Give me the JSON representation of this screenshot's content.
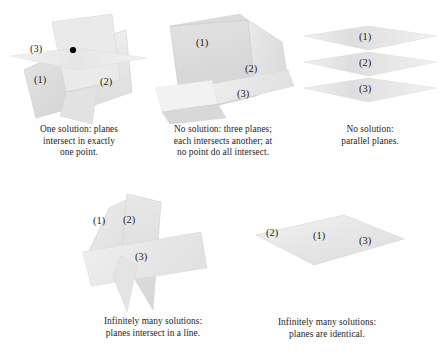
{
  "figure": {
    "background_color": "#ffffff",
    "plane_fill_light": "#e9e9e9",
    "plane_fill_mid": "#dcdcdc",
    "plane_fill_dark": "#cfcfcf",
    "plane_stroke": "#c4c4c4",
    "text_color": "#262626",
    "dot_color": "#000000"
  },
  "panels": [
    {
      "id": "one-point",
      "labels": [
        "(3)",
        "(1)",
        "(2)"
      ],
      "marker": "intersection-dot",
      "caption_lines": [
        "One solution: planes",
        "intersect in exactly",
        "one point."
      ]
    },
    {
      "id": "no-solution-three-planes",
      "labels": [
        "(1)",
        "(2)",
        "(3)"
      ],
      "caption_lines": [
        "No solution: three planes;",
        "each intersects another; at",
        "no point do all intersect."
      ]
    },
    {
      "id": "no-solution-parallel",
      "labels": [
        "(1)",
        "(2)",
        "(3)"
      ],
      "caption_lines": [
        "No solution:",
        "parallel planes."
      ]
    },
    {
      "id": "infinitely-many-line",
      "labels": [
        "(1)",
        "(2)",
        "(3)"
      ],
      "caption_lines": [
        "Infinitely many solutions:",
        "planes intersect in a line."
      ]
    },
    {
      "id": "infinitely-many-identical",
      "labels": [
        "(2)",
        "(1)",
        "(3)"
      ],
      "caption_lines": [
        "Infinitely many solutions:",
        "planes are identical."
      ]
    }
  ]
}
